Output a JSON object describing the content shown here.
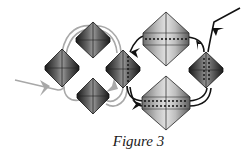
{
  "figure": {
    "caption": "Figure 3",
    "colors": {
      "background": "#ffffff",
      "gray_path": "#a8a8a8",
      "black_path": "#111111",
      "diamond_dark": "#2a2a2a",
      "diamond_light": "#cfcfcf"
    },
    "small_diamonds": [
      {
        "id": "top-left",
        "cx": 93,
        "cy": 40,
        "w": 34,
        "h": 36,
        "tone": "dark"
      },
      {
        "id": "left",
        "cx": 62,
        "cy": 68,
        "w": 35,
        "h": 38,
        "tone": "dark"
      },
      {
        "id": "bottom-left",
        "cx": 93,
        "cy": 96,
        "w": 33,
        "h": 36,
        "tone": "dark"
      },
      {
        "id": "middle",
        "cx": 123,
        "cy": 69,
        "w": 35,
        "h": 38,
        "tone": "dark"
      },
      {
        "id": "right",
        "cx": 206,
        "cy": 70,
        "w": 34,
        "h": 36,
        "tone": "dark"
      }
    ],
    "large_diamonds": [
      {
        "id": "top-large",
        "cx": 166,
        "cy": 39,
        "w": 47,
        "h": 54,
        "tone": "light"
      },
      {
        "id": "bottom-large",
        "cx": 166,
        "cy": 103,
        "w": 47,
        "h": 54,
        "tone": "light"
      }
    ],
    "paths": {
      "gray_cycle": "left -> top-left -> middle -> bottom-left -> left",
      "black_cycle": "middle -> bottom-large -> right -> top-large -> middle"
    }
  }
}
